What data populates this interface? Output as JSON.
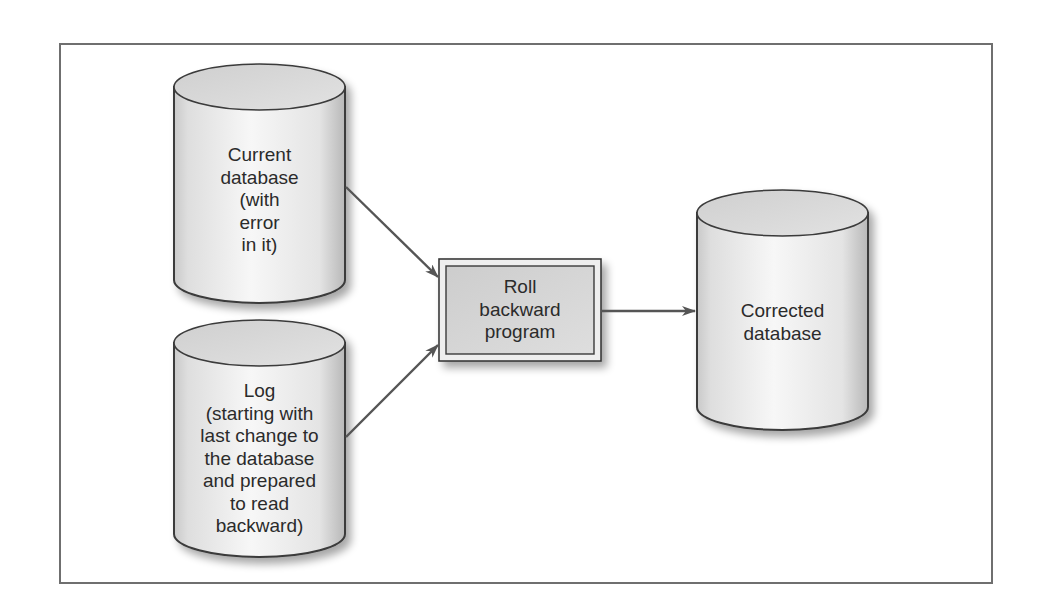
{
  "diagram": {
    "nodes": [
      {
        "id": "current-db",
        "shape": "cylinder",
        "lines": [
          "Current",
          "database",
          "(with",
          "error",
          "in it)"
        ]
      },
      {
        "id": "log",
        "shape": "cylinder",
        "lines": [
          "Log",
          "(starting with",
          "last change to",
          "the database",
          "and prepared",
          "to read",
          "backward)"
        ]
      },
      {
        "id": "program",
        "shape": "box",
        "lines": [
          "Roll",
          "backward",
          "program"
        ]
      },
      {
        "id": "corrected-db",
        "shape": "cylinder",
        "lines": [
          "Corrected",
          "database"
        ]
      }
    ],
    "edges": [
      {
        "from": "current-db",
        "to": "program"
      },
      {
        "from": "log",
        "to": "program"
      },
      {
        "from": "program",
        "to": "corrected-db"
      }
    ],
    "colors": {
      "stroke": "#3a3a3a",
      "arrow": "#555555",
      "fill_light": "#f4f4f4",
      "fill_dark": "#cfcfcf",
      "box_fill": "#d9d9d9",
      "frame": "#6f6f6f"
    }
  }
}
